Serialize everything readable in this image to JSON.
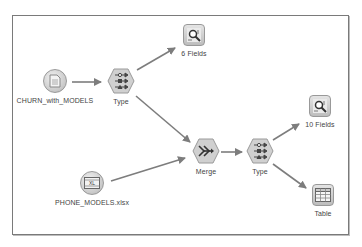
{
  "canvas": {
    "nodes": [
      {
        "id": "churn",
        "label": "CHURN_with_MODELS",
        "type": "variable-file-source",
        "icon": "document-icon"
      },
      {
        "id": "type1",
        "label": "Type",
        "type": "type-node",
        "icon": "type-icon"
      },
      {
        "id": "fields6",
        "label": "6 Fields",
        "type": "data-audit-output",
        "icon": "magnifier-icon"
      },
      {
        "id": "phone",
        "label": "PHONE_MODELS.xlsx",
        "type": "excel-source",
        "icon": "excel-icon"
      },
      {
        "id": "merge",
        "label": "Merge",
        "type": "merge-node",
        "icon": "merge-icon"
      },
      {
        "id": "type2",
        "label": "Type",
        "type": "type-node",
        "icon": "type-icon"
      },
      {
        "id": "fields10",
        "label": "10 Fields",
        "type": "data-audit-output",
        "icon": "magnifier-icon"
      },
      {
        "id": "table",
        "label": "Table",
        "type": "table-output",
        "icon": "table-icon"
      }
    ],
    "links": [
      {
        "from": "churn",
        "to": "type1"
      },
      {
        "from": "type1",
        "to": "fields6"
      },
      {
        "from": "type1",
        "to": "merge"
      },
      {
        "from": "phone",
        "to": "merge"
      },
      {
        "from": "merge",
        "to": "type2"
      },
      {
        "from": "type2",
        "to": "fields10"
      },
      {
        "from": "type2",
        "to": "table"
      }
    ],
    "colors": {
      "link": "#7d7d7d",
      "node_fill": "#d2d2d2",
      "border": "#7a7a7a"
    }
  }
}
